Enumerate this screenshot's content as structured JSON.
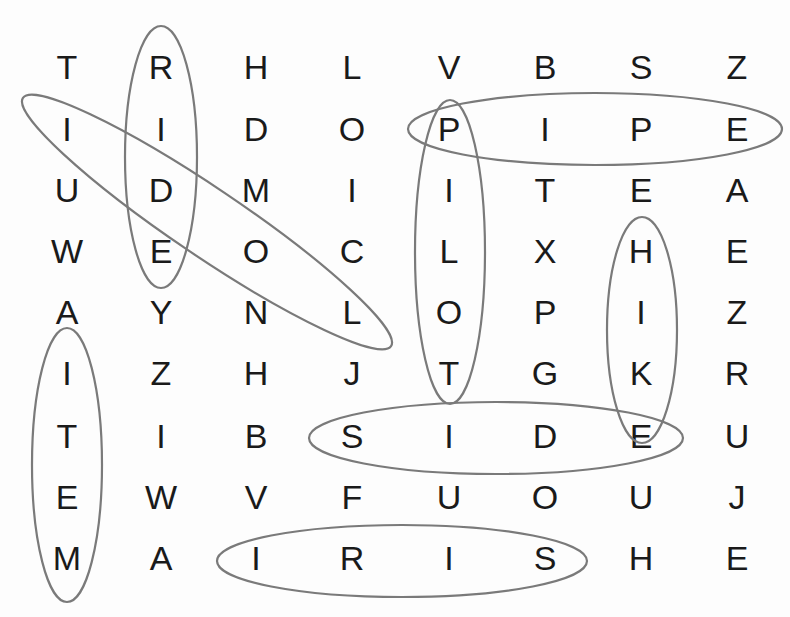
{
  "puzzle": {
    "type": "word-search",
    "rows": 9,
    "cols": 8,
    "grid": [
      [
        "T",
        "R",
        "H",
        "L",
        "V",
        "B",
        "S",
        "Z"
      ],
      [
        "I",
        "I",
        "D",
        "O",
        "P",
        "I",
        "P",
        "E"
      ],
      [
        "U",
        "D",
        "M",
        "I",
        "I",
        "T",
        "E",
        "A"
      ],
      [
        "W",
        "E",
        "O",
        "C",
        "L",
        "X",
        "H",
        "E"
      ],
      [
        "A",
        "Y",
        "N",
        "L",
        "O",
        "P",
        "I",
        "Z"
      ],
      [
        "I",
        "Z",
        "H",
        "J",
        "T",
        "G",
        "K",
        "R"
      ],
      [
        "T",
        "I",
        "B",
        "S",
        "I",
        "D",
        "E",
        "U"
      ],
      [
        "E",
        "W",
        "V",
        "F",
        "U",
        "O",
        "U",
        "J"
      ],
      [
        "M",
        "A",
        "I",
        "R",
        "I",
        "S",
        "H",
        "E"
      ]
    ],
    "found_words": [
      {
        "word": "RIDE",
        "start": [
          0,
          1
        ],
        "end": [
          3,
          1
        ],
        "direction": "down"
      },
      {
        "word": "IDOL",
        "start": [
          1,
          0
        ],
        "end": [
          4,
          3
        ],
        "direction": "diagonal-down-right"
      },
      {
        "word": "PIPE",
        "start": [
          1,
          4
        ],
        "end": [
          1,
          7
        ],
        "direction": "right"
      },
      {
        "word": "PILOT",
        "start": [
          1,
          4
        ],
        "end": [
          5,
          4
        ],
        "direction": "down"
      },
      {
        "word": "HIKE",
        "start": [
          3,
          6
        ],
        "end": [
          6,
          6
        ],
        "direction": "down"
      },
      {
        "word": "ITEM",
        "start": [
          5,
          0
        ],
        "end": [
          8,
          0
        ],
        "direction": "down"
      },
      {
        "word": "SIDE",
        "start": [
          6,
          3
        ],
        "end": [
          6,
          6
        ],
        "direction": "right"
      },
      {
        "word": "IRIS",
        "start": [
          8,
          2
        ],
        "end": [
          8,
          5
        ],
        "direction": "right"
      }
    ]
  },
  "layout": {
    "col_x": [
      67,
      161,
      256,
      352,
      449,
      545,
      641,
      737
    ],
    "row_y": [
      67,
      129,
      190,
      251,
      312,
      373,
      436,
      497,
      558
    ]
  },
  "ovals": [
    {
      "name": "oval-ride",
      "cx": 161,
      "cy": 157,
      "rx": 36,
      "ry": 131,
      "rot": 0
    },
    {
      "name": "oval-idol",
      "cx": 207,
      "cy": 222,
      "rx": 222,
      "ry": 34,
      "rot": 34
    },
    {
      "name": "oval-pipe",
      "cx": 595,
      "cy": 129,
      "rx": 187,
      "ry": 36,
      "rot": 0
    },
    {
      "name": "oval-pilot",
      "cx": 450,
      "cy": 252,
      "rx": 35,
      "ry": 152,
      "rot": 0
    },
    {
      "name": "oval-hike",
      "cx": 642,
      "cy": 330,
      "rx": 35,
      "ry": 113,
      "rot": 0
    },
    {
      "name": "oval-item",
      "cx": 67,
      "cy": 465,
      "rx": 35,
      "ry": 137,
      "rot": 0
    },
    {
      "name": "oval-side",
      "cx": 496,
      "cy": 438,
      "rx": 187,
      "ry": 36,
      "rot": 0
    },
    {
      "name": "oval-iris",
      "cx": 402,
      "cy": 561,
      "rx": 185,
      "ry": 36,
      "rot": 0
    }
  ],
  "colors": {
    "letter": "#1a1a1a",
    "oval_stroke": "#7a7a7a",
    "background": "#fdfdfd"
  }
}
